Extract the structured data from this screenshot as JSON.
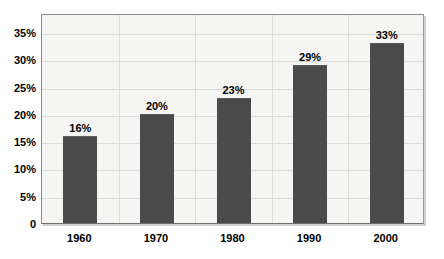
{
  "chart_data": {
    "type": "bar",
    "title": "",
    "subtitle": "",
    "xlabel": "",
    "ylabel": "",
    "categories": [
      "1960",
      "1970",
      "1980",
      "1990",
      "2000"
    ],
    "values": [
      16,
      20,
      23,
      29,
      33
    ],
    "data_labels": [
      "16%",
      "20%",
      "23%",
      "29%",
      "33%"
    ],
    "ylim": [
      0,
      38.5
    ],
    "ytick_values": [
      0,
      5,
      10,
      15,
      20,
      25,
      30,
      35
    ],
    "ytick_labels": [
      "0",
      "5%",
      "10%",
      "15%",
      "20%",
      "25%",
      "30%",
      "35%"
    ],
    "grid": {
      "horizontal": true,
      "vertical": true,
      "color": "#dcdcda"
    },
    "legend": {
      "visible": false,
      "entries": []
    },
    "colors": {
      "bar": "#4a4a4a",
      "plot_background": "#f5f5f3",
      "page_background": "#ffffff",
      "frame_border": "#8a8a8a",
      "text": "#000000"
    },
    "series": [
      {
        "name": "Series 1",
        "values": [
          16,
          20,
          23,
          29,
          33
        ]
      }
    ]
  }
}
